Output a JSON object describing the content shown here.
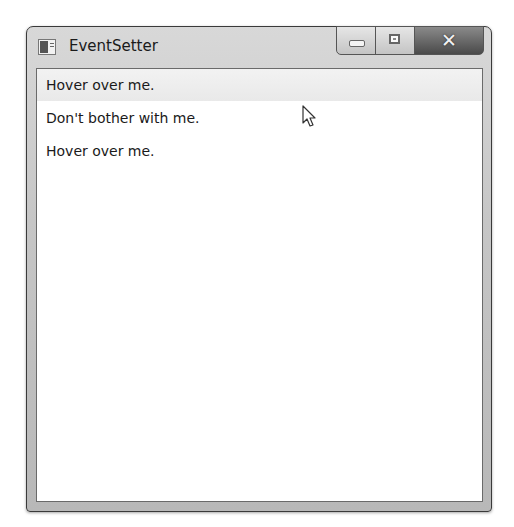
{
  "window": {
    "title": "EventSetter",
    "icon": "wpf-app-icon",
    "caption_buttons": [
      {
        "name": "minimize",
        "glyph": ""
      },
      {
        "name": "maximize",
        "glyph": ""
      },
      {
        "name": "close",
        "glyph": "✕"
      }
    ]
  },
  "content": {
    "items": [
      {
        "label": "Hover over me.",
        "state": "hovered"
      },
      {
        "label": "Don't bother with me.",
        "state": "normal"
      },
      {
        "label": "Hover over me.",
        "state": "normal"
      }
    ]
  },
  "colors": {
    "hover_background": "#eeeeee",
    "text": "#1a1a1a",
    "client_background": "#ffffff"
  }
}
